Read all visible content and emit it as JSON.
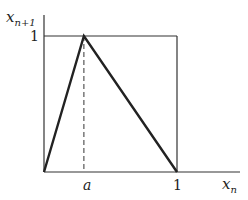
{
  "axes": {
    "x_label": "x",
    "x_label_sub": "n",
    "y_label": "x",
    "y_label_sub": "n+1"
  },
  "ticks": {
    "x": [
      {
        "label": "a",
        "value": 0.3
      },
      {
        "label": "1",
        "value": 1
      }
    ],
    "y": [
      {
        "label": "1",
        "value": 1
      }
    ]
  },
  "map": {
    "points": [
      [
        0,
        0
      ],
      [
        0.3,
        1
      ],
      [
        1,
        0
      ]
    ],
    "peak_param": "a"
  },
  "colors": {
    "line": "#222222",
    "axis": "#333333"
  }
}
